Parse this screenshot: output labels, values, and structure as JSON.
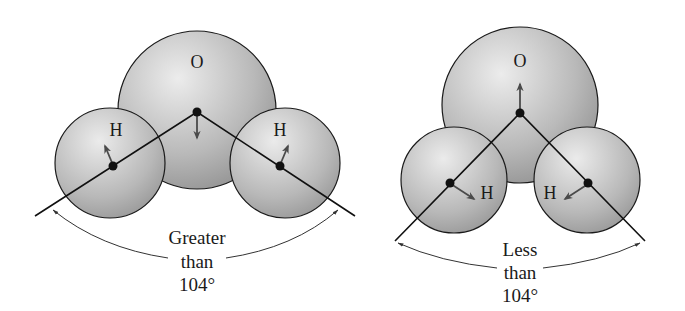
{
  "diagram": {
    "left_molecule": {
      "atoms": {
        "oxygen": "O",
        "hydrogen_left": "H",
        "hydrogen_right": "H"
      },
      "angle_label": {
        "line1": "Greater",
        "line2": "than",
        "line3": "104°"
      }
    },
    "right_molecule": {
      "atoms": {
        "oxygen": "O",
        "hydrogen_left": "H",
        "hydrogen_right": "H"
      },
      "angle_label": {
        "line1": "Less",
        "line2": "than",
        "line3": "104°"
      }
    },
    "colors": {
      "sphere_light": "#e8e8e8",
      "sphere_dark": "#8f8f8f",
      "outline": "#1a1a1a",
      "arrow": "#555555"
    }
  }
}
